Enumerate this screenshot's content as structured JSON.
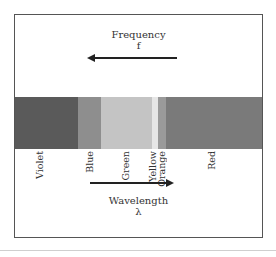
{
  "diagram": {
    "top_label": {
      "title": "Frequency",
      "symbol": "f",
      "arrow_direction": "left"
    },
    "bottom_label": {
      "title": "Wavelength",
      "symbol": "λ",
      "arrow_direction": "right"
    },
    "bands": [
      {
        "name": "Violet",
        "color": "#5a5a5a",
        "left": 0,
        "width": 63
      },
      {
        "name": "Blue",
        "color": "#8e8e8e",
        "left": 63,
        "width": 23
      },
      {
        "name": "Green",
        "color": "#c4c4c4",
        "left": 86,
        "width": 51
      },
      {
        "name": "Yellow",
        "color": "#e6e6e6",
        "left": 137,
        "width": 6
      },
      {
        "name": "Orange",
        "color": "#9a9a9a",
        "left": 143,
        "width": 8
      },
      {
        "name": "Red",
        "color": "#7a7a7a",
        "left": 151,
        "width": 96
      }
    ],
    "labels": {
      "violet": "Violet",
      "blue": "Blue",
      "green": "Green",
      "yellow": "Yellow",
      "orange": "Orange",
      "red": "Red"
    }
  }
}
